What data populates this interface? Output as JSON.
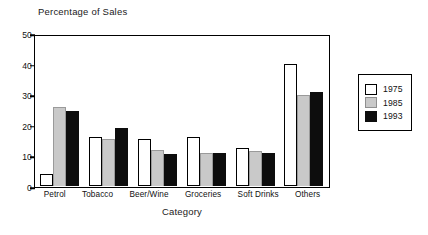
{
  "chart_data": {
    "type": "bar",
    "title": "Percentage of Sales",
    "xlabel": "Category",
    "ylabel": "",
    "ylim": [
      0,
      50
    ],
    "yticks": [
      0,
      10,
      20,
      30,
      40,
      50
    ],
    "grid": false,
    "legend_position": "right",
    "categories": [
      "Petrol",
      "Tobacco",
      "Beer/Wine",
      "Groceries",
      "Soft Drinks",
      "Others"
    ],
    "series": [
      {
        "name": "1975",
        "color": "#ffffff",
        "values": [
          4,
          16,
          15.5,
          16,
          12.5,
          40
        ]
      },
      {
        "name": "1985",
        "color": "#c9c9c9",
        "values": [
          26,
          15.5,
          12,
          11,
          11.5,
          30
        ]
      },
      {
        "name": "1993",
        "color": "#0d0d0d",
        "values": [
          24.5,
          19,
          10.5,
          11,
          11,
          31
        ]
      }
    ]
  }
}
